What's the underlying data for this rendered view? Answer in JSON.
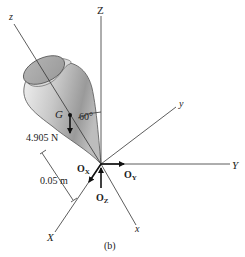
{
  "figure": {
    "caption": "(b)",
    "axes": {
      "global_Z": "Z",
      "global_Y": "Y",
      "global_X": "X",
      "local_z": "z",
      "local_y": "y",
      "local_x": "x"
    },
    "center_of_gravity": "G",
    "angle_label": "60°",
    "weight_label": "4.905 N",
    "distance_label": "0.05 m",
    "reactions": {
      "ox_main": "O",
      "ox_sub": "X",
      "oy_main": "O",
      "oy_sub": "Y",
      "oz_main": "O",
      "oz_sub": "Z"
    },
    "colors": {
      "line": "#333333",
      "body_light": "#e6e6e6",
      "body_dark": "#8c8c8c",
      "cap": "#a8a8a8"
    }
  }
}
